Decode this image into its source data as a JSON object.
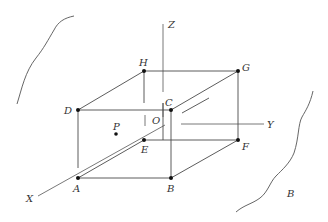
{
  "figure": {
    "type": "3d-box-coordinate-diagram",
    "axes": {
      "x": "X",
      "y": "Y",
      "z": "Z",
      "origin": "O"
    },
    "vertices": {
      "A": "A",
      "B": "B",
      "C": "C",
      "D": "D",
      "E": "E",
      "F": "F",
      "G": "G",
      "H": "H"
    },
    "point": "P",
    "region_label": "B"
  }
}
